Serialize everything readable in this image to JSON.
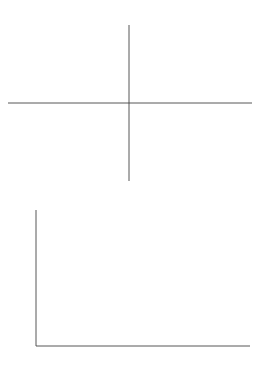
{
  "chart_data": [
    {
      "type": "line",
      "title": "",
      "xlabel": "x",
      "ylabel": "z (x)",
      "xlim": [
        -0.5,
        0.5
      ],
      "ylim": [
        -0.05,
        0.05
      ],
      "xticks": [
        "-0.4",
        "-0.2",
        "0.2",
        "0.4"
      ],
      "yticks": [
        "0.04",
        "0.02",
        "-0.02",
        "-0.04"
      ],
      "grid": false,
      "series": [
        {
          "name": "z(x)",
          "x": [
            -0.5,
            -0.48,
            -0.46,
            -0.44,
            -0.42,
            -0.4,
            -0.38,
            -0.36,
            -0.34,
            -0.32,
            -0.3,
            -0.28,
            -0.26,
            -0.24,
            -0.22,
            -0.2,
            -0.18,
            -0.16,
            -0.14,
            -0.12,
            -0.1,
            -0.08,
            -0.06,
            -0.04,
            -0.02,
            0.0,
            0.02,
            0.04,
            0.06,
            0.08,
            0.1,
            0.12,
            0.14,
            0.16,
            0.18,
            0.2,
            0.22,
            0.24,
            0.26,
            0.28,
            0.3,
            0.32,
            0.34,
            0.36,
            0.38,
            0.4,
            0.42,
            0.44,
            0.46,
            0.48,
            0.5
          ],
          "values": [
            -0.005,
            -0.005,
            -0.007,
            -0.006,
            -0.007,
            -0.004,
            -0.006,
            -0.003,
            -0.004,
            -0.008,
            -0.009,
            -0.011,
            -0.013,
            -0.014,
            -0.012,
            -0.01,
            -0.011,
            -0.009,
            -0.008,
            -0.01,
            -0.008,
            -0.006,
            -0.005,
            -0.004,
            -0.002,
            0.0,
            0.004,
            0.006,
            0.007,
            0.009,
            0.008,
            0.007,
            0.01,
            0.009,
            0.01,
            0.012,
            0.014,
            0.013,
            0.009,
            0.008,
            0.006,
            0.002,
            0.001,
            0.004,
            0.005,
            0.004,
            0.007,
            0.008,
            0.006,
            0.004,
            0.005
          ]
        }
      ]
    },
    {
      "type": "line",
      "title": "",
      "xlabel": "θs",
      "ylabel": "|E|²",
      "yscale": "log",
      "ylim": [
        0.0001,
        1
      ],
      "xlim": [
        "-π/2",
        "π/2"
      ],
      "xticks": [
        "-π/2",
        "-π/4",
        "0",
        "π/4",
        "π/2"
      ],
      "yticks": [
        "1",
        "0.1",
        "0.01",
        "0.001"
      ],
      "grid": false,
      "series": [
        {
          "name": "|E|^2 lobes (theta in units of pi/4, peak value)",
          "lobes": [
            {
              "start": -1.78,
              "end": -1.36,
              "peak_at": -1.58,
              "peak": 0.0007
            },
            {
              "start": -1.25,
              "end": -1.12,
              "peak_at": -1.19,
              "peak": 0.0003
            },
            {
              "start": -1.06,
              "end": -0.79,
              "peak_at": -0.93,
              "peak": 0.0045
            },
            {
              "start": -0.77,
              "end": -0.64,
              "peak_at": -0.71,
              "peak": 0.0011
            },
            {
              "start": -0.54,
              "end": -0.45,
              "peak_at": -0.5,
              "peak": 0.0003
            },
            {
              "start": -0.42,
              "end": -0.33,
              "peak_at": -0.38,
              "peak": 0.00045
            },
            {
              "start": -0.27,
              "end": -0.16,
              "peak_at": -0.22,
              "peak": 0.00095
            },
            {
              "start": -0.14,
              "end": -0.01,
              "peak_at": -0.08,
              "peak": 0.0011
            },
            {
              "start": 0.0,
              "end": 0.35,
              "peak_at": 0.2,
              "peak": 0.0085
            },
            {
              "start": 0.35,
              "end": 0.52,
              "peak_at": 0.42,
              "peak": 0.016
            },
            {
              "start": 0.52,
              "end": 1.06,
              "peak_at": 0.59,
              "peak": 0.08
            },
            {
              "start": 1.06,
              "end": 1.37,
              "peak_at": 1.21,
              "peak": 0.8
            },
            {
              "start": 1.37,
              "end": 1.71,
              "peak_at": 1.5,
              "peak": 0.2
            },
            {
              "start": 1.71,
              "end": 2.04,
              "peak_at": 1.84,
              "peak": 0.01
            }
          ]
        }
      ]
    }
  ],
  "top_plot": {
    "ylabel": "z (x)",
    "xlabel": "x",
    "yticks": [
      {
        "label": "0.04",
        "value": 0.04
      },
      {
        "label": "0.02",
        "value": 0.02
      },
      {
        "label": "−0.02",
        "value": -0.02
      },
      {
        "label": "−0.04",
        "value": -0.04
      }
    ],
    "xticks": [
      {
        "label": "−0.4",
        "value": -0.4
      },
      {
        "label": "−0.2",
        "value": -0.2
      },
      {
        "label": "0.2",
        "value": 0.2
      },
      {
        "label": "0.4",
        "value": 0.4
      }
    ]
  },
  "bottom_plot": {
    "ylabel": "|E|",
    "ylabel_sup": "2",
    "xlabel": "θ",
    "xlabel_sub": "s",
    "yticks": [
      {
        "label": "1",
        "value": 1
      },
      {
        "label": "0.1",
        "value": 0.1
      },
      {
        "label": "0.01",
        "value": 0.01
      },
      {
        "label": "0.001",
        "value": 0.001
      }
    ],
    "xticks": [
      {
        "sign": "−",
        "num": "π",
        "den": "2",
        "pos": -2
      },
      {
        "sign": "−",
        "num": "π",
        "den": "4",
        "pos": -1
      },
      {
        "sign": "",
        "num": "0",
        "den": "",
        "pos": 0
      },
      {
        "sign": "",
        "num": "π",
        "den": "4",
        "pos": 1
      },
      {
        "sign": "",
        "num": "π",
        "den": "2",
        "pos": 2
      }
    ]
  },
  "colors": {
    "line": "#333333",
    "axis": "#444444",
    "text": "#222222",
    "background": "#ffffff"
  }
}
